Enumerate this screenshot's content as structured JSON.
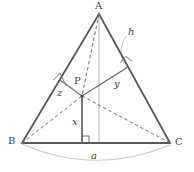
{
  "figure": {
    "vertices": [
      {
        "name": "A",
        "label": "A",
        "x": 99,
        "y": 14,
        "label_x": 95,
        "label_y": 2
      },
      {
        "name": "B",
        "label": "B",
        "x": 22,
        "y": 143,
        "label_x": 9,
        "label_y": 137
      },
      {
        "name": "C",
        "label": "C",
        "x": 170,
        "y": 143,
        "label_x": 175,
        "label_y": 138
      }
    ],
    "interior_point": {
      "name": "P",
      "label": "P",
      "x": 82,
      "y": 96,
      "label_x": 74,
      "label_y": 77
    },
    "segment_labels": [
      {
        "name": "h",
        "label": "h",
        "label_x": 128,
        "label_y": 28
      },
      {
        "name": "y",
        "label": "y",
        "label_x": 114,
        "label_y": 80
      },
      {
        "name": "z",
        "label": "z",
        "label_x": 57,
        "label_y": 88
      },
      {
        "name": "x",
        "label": "x",
        "label_x": 72,
        "label_y": 118
      },
      {
        "name": "a",
        "label": "a",
        "label_x": 91,
        "label_y": 152
      }
    ],
    "feet": {
      "base_foot": {
        "x": 82,
        "y": 143
      },
      "ac_foot": {
        "x": 128,
        "y": 67
      },
      "ab_foot": {
        "x": 60,
        "y": 80
      },
      "altitude_foot": {
        "x": 99,
        "y": 143
      }
    },
    "colors": {
      "outline": "#555555",
      "base": "#5a5a5a",
      "dashed": "#6e6e6e",
      "altitude": "#b9b9b9",
      "arc": "#c8c8c8",
      "leader": "#c0c0c0",
      "solid_drop": "#6a6a6a",
      "right_angle": "#7a7a7a",
      "text": "#3a3a3a"
    }
  }
}
